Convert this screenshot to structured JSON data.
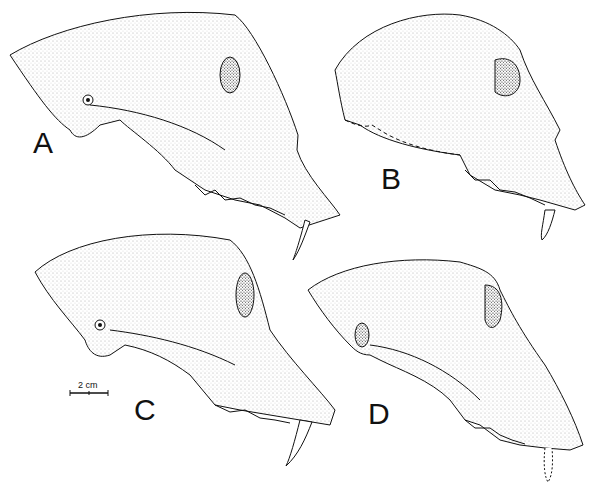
{
  "figure": {
    "panels": [
      {
        "id": "A",
        "label": "A",
        "description": "primate skull lateral view, large cranium with prominent canine"
      },
      {
        "id": "B",
        "label": "B",
        "description": "primate skull lateral view, partially reconstructed (dashed outline)"
      },
      {
        "id": "C",
        "label": "C",
        "description": "primate skull lateral view with long canine"
      },
      {
        "id": "D",
        "label": "D",
        "description": "primate skull lateral view with sagittal crest, dashed canine"
      }
    ],
    "scale_bar": {
      "label": "2 cm"
    }
  }
}
